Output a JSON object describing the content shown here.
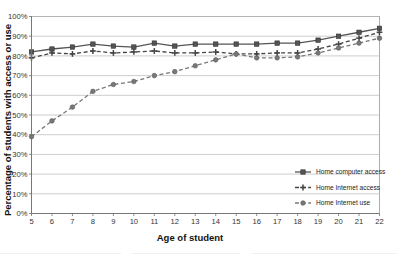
{
  "chart_data": {
    "type": "line",
    "title": "",
    "xlabel": "Age of student",
    "ylabel": "Percentage of students with access or use",
    "x": [
      5,
      6,
      7,
      8,
      9,
      10,
      11,
      12,
      13,
      14,
      15,
      16,
      17,
      18,
      19,
      20,
      21,
      22
    ],
    "categories": [
      "5",
      "6",
      "7",
      "8",
      "9",
      "10",
      "11",
      "12",
      "13",
      "14",
      "15",
      "16",
      "17",
      "18",
      "19",
      "20",
      "21",
      "22"
    ],
    "xlim": [
      5,
      22
    ],
    "ylim": [
      0,
      100
    ],
    "yticks": [
      0,
      10,
      20,
      30,
      40,
      50,
      60,
      70,
      80,
      90,
      100
    ],
    "ytick_labels": [
      "0%",
      "10%",
      "20%",
      "30%",
      "40%",
      "50%",
      "60%",
      "70%",
      "80%",
      "90%",
      "100%"
    ],
    "grid": true,
    "grid_axis": "y",
    "legend_position": "right-inside-bottom",
    "series": [
      {
        "name": "Home computer access",
        "marker": "square",
        "line_style": "solid",
        "color": "#555555",
        "values": [
          82,
          83.5,
          84.5,
          86,
          85,
          84.5,
          86.5,
          85,
          86,
          86,
          86,
          86,
          86.5,
          86.5,
          88,
          90,
          92,
          94
        ]
      },
      {
        "name": "Home Internet access",
        "marker": "plus",
        "line_style": "dashed",
        "color": "#444444",
        "values": [
          79,
          81.5,
          81,
          82.5,
          81.5,
          82,
          82.5,
          81.5,
          81.5,
          82,
          81,
          81,
          81.5,
          81.5,
          83.5,
          86,
          89,
          92
        ]
      },
      {
        "name": "Home Internet use",
        "marker": "circle",
        "line_style": "dashed",
        "color": "#787878",
        "values": [
          39,
          47,
          54,
          62,
          65.5,
          67,
          70,
          72,
          75,
          78,
          81,
          79,
          79,
          79.5,
          81.5,
          84,
          86.5,
          89
        ]
      }
    ],
    "legend": [
      {
        "label": "Home computer access",
        "marker": "square",
        "line_style": "solid",
        "color": "#555555"
      },
      {
        "label": "Home Internet access",
        "marker": "plus",
        "line_style": "dashed",
        "color": "#444444"
      },
      {
        "label": "Home Internet use",
        "marker": "circle",
        "line_style": "dashed",
        "color": "#787878"
      }
    ]
  },
  "colors": {
    "background": "#ffffff",
    "grid": "#b8b8b8",
    "axis": "#707070",
    "text": "#1a1a1a"
  }
}
